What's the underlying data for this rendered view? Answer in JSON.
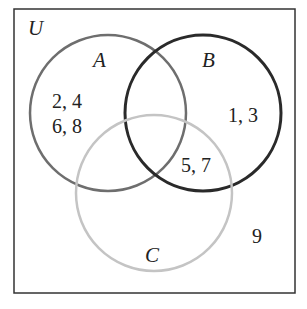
{
  "diagram": {
    "type": "venn",
    "universe": {
      "label": "U"
    },
    "sets": [
      {
        "label": "A",
        "color": "#6e6e6e"
      },
      {
        "label": "B",
        "color": "#2a2a2a"
      },
      {
        "label": "C",
        "color": "#bdbdbd"
      }
    ],
    "regions": {
      "a_only_line1": "2, 4",
      "a_only_line2": "6, 8",
      "b_only": "1, 3",
      "b_and_c": "5, 7",
      "outside": "9"
    }
  }
}
